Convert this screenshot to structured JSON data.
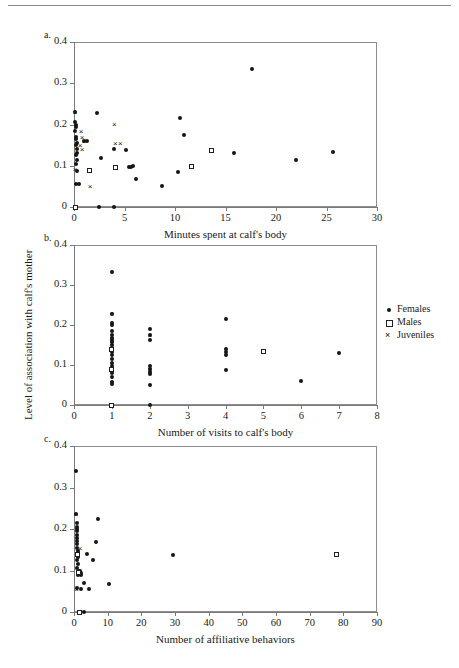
{
  "figure": {
    "shared_ylabel": "Level of association with calf's mother",
    "yticks": [
      "0",
      "0.1",
      "0.2",
      "0.3",
      "0.4"
    ]
  },
  "legend": {
    "position": "right-of-panel-b",
    "items": [
      {
        "label": "Females",
        "symbol": "filled-circle",
        "icon": "circle-icon"
      },
      {
        "label": "Males",
        "symbol": "open-square",
        "icon": "square-icon"
      },
      {
        "label": "Juveniles",
        "symbol": "cross",
        "icon": "cross-icon"
      }
    ]
  },
  "panels": [
    {
      "id": "a",
      "label": "a.",
      "xlabel": "Minutes spent at calf's body",
      "xticks": [
        "0",
        "5",
        "10",
        "15",
        "20",
        "25",
        "30"
      ]
    },
    {
      "id": "b",
      "label": "b.",
      "xlabel": "Number of visits to calf's body",
      "xticks": [
        "0",
        "1",
        "2",
        "3",
        "4",
        "5",
        "6",
        "7",
        "8"
      ]
    },
    {
      "id": "c",
      "label": "c.",
      "xlabel": "Number of affiliative behaviors",
      "xticks": [
        "0",
        "10",
        "20",
        "30",
        "40",
        "50",
        "60",
        "70",
        "80",
        "90"
      ]
    }
  ],
  "chart_data": [
    {
      "type": "scatter",
      "panel": "a",
      "title": "",
      "xlabel": "Minutes spent at calf's body",
      "ylabel": "Level of association with calf's mother",
      "xlim": [
        0,
        30
      ],
      "ylim": [
        0,
        0.4
      ],
      "xticks": [
        0,
        5,
        10,
        15,
        20,
        25,
        30
      ],
      "yticks": [
        0,
        0.1,
        0.2,
        0.3,
        0.4
      ],
      "grid": false,
      "legend": [
        "Females",
        "Males",
        "Juveniles"
      ],
      "series": [
        {
          "name": "Females",
          "marker": "filled-circle",
          "points": [
            [
              0.1,
              0.23
            ],
            [
              0.1,
              0.205
            ],
            [
              0.15,
              0.2
            ],
            [
              0.2,
              0.195
            ],
            [
              0.1,
              0.185
            ],
            [
              0.15,
              0.17
            ],
            [
              0.2,
              0.165
            ],
            [
              0.3,
              0.155
            ],
            [
              0.2,
              0.15
            ],
            [
              0.25,
              0.14
            ],
            [
              0.3,
              0.132
            ],
            [
              0.2,
              0.125
            ],
            [
              0.25,
              0.115
            ],
            [
              0.2,
              0.105
            ],
            [
              0.3,
              0.088
            ],
            [
              0.2,
              0.055
            ],
            [
              0.45,
              0.055
            ],
            [
              1.0,
              0.16
            ],
            [
              1.3,
              0.16
            ],
            [
              2.3,
              0.228
            ],
            [
              2.7,
              0.12
            ],
            [
              4.0,
              0.14
            ],
            [
              5.1,
              0.138
            ],
            [
              5.4,
              0.098
            ],
            [
              5.6,
              0.098
            ],
            [
              5.8,
              0.1
            ],
            [
              6.1,
              0.068
            ],
            [
              8.7,
              0.05
            ],
            [
              10.3,
              0.085
            ],
            [
              10.5,
              0.215
            ],
            [
              10.9,
              0.175
            ],
            [
              15.8,
              0.132
            ],
            [
              17.6,
              0.335
            ],
            [
              22.0,
              0.113
            ],
            [
              25.6,
              0.133
            ],
            [
              2.5,
              0.0
            ],
            [
              4.0,
              0.0
            ]
          ]
        },
        {
          "name": "Males",
          "marker": "open-square",
          "points": [
            [
              0.1,
              0.0
            ],
            [
              1.5,
              0.088
            ],
            [
              4.1,
              0.096
            ],
            [
              11.6,
              0.097
            ],
            [
              13.6,
              0.138
            ]
          ]
        },
        {
          "name": "Juveniles",
          "marker": "cross",
          "points": [
            [
              0.1,
              0.23
            ],
            [
              0.7,
              0.183
            ],
            [
              0.8,
              0.168
            ],
            [
              1.0,
              0.158
            ],
            [
              0.6,
              0.148
            ],
            [
              0.8,
              0.14
            ],
            [
              0.1,
              0.09
            ],
            [
              1.6,
              0.05
            ],
            [
              4.0,
              0.2
            ],
            [
              4.1,
              0.155
            ],
            [
              4.6,
              0.155
            ]
          ]
        }
      ]
    },
    {
      "type": "scatter",
      "panel": "b",
      "title": "",
      "xlabel": "Number of visits to calf's body",
      "ylabel": "Level of association with calf's mother",
      "xlim": [
        0,
        8
      ],
      "ylim": [
        0,
        0.4
      ],
      "xticks": [
        0,
        1,
        2,
        3,
        4,
        5,
        6,
        7,
        8
      ],
      "yticks": [
        0,
        0.1,
        0.2,
        0.3,
        0.4
      ],
      "grid": false,
      "legend": [
        "Females",
        "Males",
        "Juveniles"
      ],
      "series": [
        {
          "name": "Females",
          "marker": "filled-circle",
          "points": [
            [
              1.0,
              0.333
            ],
            [
              1.0,
              0.228
            ],
            [
              1.0,
              0.205
            ],
            [
              1.0,
              0.2
            ],
            [
              1.0,
              0.185
            ],
            [
              1.0,
              0.175
            ],
            [
              1.0,
              0.168
            ],
            [
              1.0,
              0.163
            ],
            [
              1.0,
              0.158
            ],
            [
              1.0,
              0.15
            ],
            [
              1.0,
              0.14
            ],
            [
              1.0,
              0.133
            ],
            [
              1.0,
              0.125
            ],
            [
              1.0,
              0.115
            ],
            [
              1.0,
              0.105
            ],
            [
              1.0,
              0.098
            ],
            [
              1.0,
              0.088
            ],
            [
              1.0,
              0.08
            ],
            [
              1.0,
              0.07
            ],
            [
              1.0,
              0.058
            ],
            [
              1.0,
              0.052
            ],
            [
              1.0,
              0.0
            ],
            [
              2.0,
              0.19
            ],
            [
              2.0,
              0.175
            ],
            [
              2.0,
              0.163
            ],
            [
              2.0,
              0.098
            ],
            [
              2.0,
              0.09
            ],
            [
              2.0,
              0.082
            ],
            [
              2.0,
              0.078
            ],
            [
              2.0,
              0.05
            ],
            [
              2.0,
              0.0
            ],
            [
              4.0,
              0.215
            ],
            [
              4.0,
              0.14
            ],
            [
              4.0,
              0.132
            ],
            [
              4.0,
              0.125
            ],
            [
              4.0,
              0.088
            ],
            [
              6.0,
              0.06
            ],
            [
              7.0,
              0.13
            ]
          ]
        },
        {
          "name": "Males",
          "marker": "open-square",
          "points": [
            [
              1.0,
              0.138
            ],
            [
              1.0,
              0.088
            ],
            [
              1.0,
              0.0
            ],
            [
              5.0,
              0.135
            ]
          ]
        },
        {
          "name": "Juveniles",
          "marker": "cross",
          "points": [
            [
              1.0,
              0.228
            ],
            [
              1.0,
              0.158
            ],
            [
              1.0,
              0.148
            ],
            [
              2.0,
              0.175
            ],
            [
              2.0,
              0.088
            ]
          ]
        }
      ]
    },
    {
      "type": "scatter",
      "panel": "c",
      "title": "",
      "xlabel": "Number of affiliative behaviors",
      "ylabel": "Level of association with calf's mother",
      "xlim": [
        0,
        90
      ],
      "ylim": [
        0,
        0.4
      ],
      "xticks": [
        0,
        10,
        20,
        30,
        40,
        50,
        60,
        70,
        80,
        90
      ],
      "yticks": [
        0,
        0.1,
        0.2,
        0.3,
        0.4
      ],
      "grid": false,
      "legend": [
        "Females",
        "Males",
        "Juveniles"
      ],
      "series": [
        {
          "name": "Females",
          "marker": "filled-circle",
          "points": [
            [
              0.5,
              0.34
            ],
            [
              0.5,
              0.235
            ],
            [
              0.8,
              0.215
            ],
            [
              0.8,
              0.205
            ],
            [
              0.8,
              0.2
            ],
            [
              0.8,
              0.195
            ],
            [
              0.8,
              0.185
            ],
            [
              1.0,
              0.178
            ],
            [
              1.0,
              0.17
            ],
            [
              1.0,
              0.163
            ],
            [
              1.0,
              0.155
            ],
            [
              1.2,
              0.148
            ],
            [
              1.0,
              0.14
            ],
            [
              1.2,
              0.133
            ],
            [
              1.0,
              0.125
            ],
            [
              1.2,
              0.115
            ],
            [
              1.0,
              0.105
            ],
            [
              1.4,
              0.1
            ],
            [
              1.8,
              0.098
            ],
            [
              2.2,
              0.095
            ],
            [
              1.2,
              0.09
            ],
            [
              2.0,
              0.088
            ],
            [
              1.0,
              0.058
            ],
            [
              2.0,
              0.055
            ],
            [
              3.0,
              0.07
            ],
            [
              4.5,
              0.055
            ],
            [
              4.0,
              0.14
            ],
            [
              5.5,
              0.125
            ],
            [
              7.0,
              0.225
            ],
            [
              6.5,
              0.168
            ],
            [
              10.5,
              0.068
            ],
            [
              29.5,
              0.137
            ],
            [
              3.0,
              0.0
            ]
          ]
        },
        {
          "name": "Males",
          "marker": "open-square",
          "points": [
            [
              1.0,
              0.138
            ],
            [
              1.2,
              0.095
            ],
            [
              1.5,
              0.0
            ],
            [
              78.0,
              0.138
            ]
          ]
        },
        {
          "name": "Juveniles",
          "marker": "cross",
          "points": [
            [
              0.6,
              0.235
            ],
            [
              1.8,
              0.152
            ],
            [
              1.0,
              0.145
            ],
            [
              0.8,
              0.055
            ]
          ]
        }
      ]
    }
  ]
}
